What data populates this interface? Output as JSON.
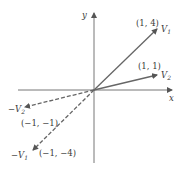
{
  "axes": {
    "x_label": "x",
    "y_label": "y"
  },
  "vectors": [
    {
      "name": "V1",
      "label_main": "V",
      "label_sub": "1",
      "point_label": "(1, 4)",
      "style": "solid"
    },
    {
      "name": "V2",
      "label_main": "V",
      "label_sub": "2",
      "point_label": "(1, 1)",
      "style": "solid"
    },
    {
      "name": "-V2",
      "label_main": "−V",
      "label_sub": "2",
      "point_label": "(−1, −1)",
      "style": "dashed"
    },
    {
      "name": "-V1",
      "label_main": "−V",
      "label_sub": "1",
      "point_label": "(−1, −4)",
      "style": "dashed"
    }
  ],
  "colors": {
    "axis": "#555555",
    "vector": "#666666",
    "text": "#3a3a3a"
  }
}
